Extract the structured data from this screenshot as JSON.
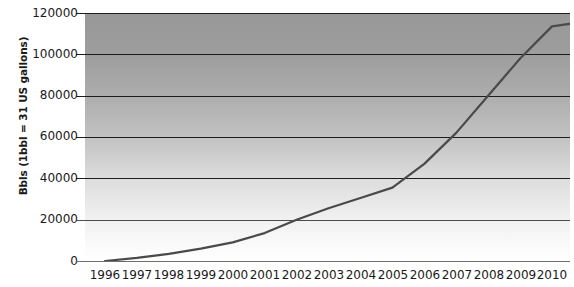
{
  "chart_data": {
    "type": "line",
    "title": "",
    "xlabel": "",
    "ylabel": "Bbls (1bbl = 31 US gallons)",
    "x": [
      1996,
      1997,
      1998,
      1999,
      2000,
      2001,
      2002,
      2003,
      2004,
      2005,
      2006,
      2007,
      2008,
      2009,
      2010
    ],
    "categories": [
      "1996",
      "1997",
      "1998",
      "1999",
      "2000",
      "2001",
      "2002",
      "2003",
      "2004",
      "2005",
      "2006",
      "2007",
      "2008",
      "2009",
      "2010"
    ],
    "values": [
      0,
      1500,
      3500,
      6000,
      9000,
      13500,
      20000,
      25500,
      30500,
      35500,
      47000,
      62000,
      80000,
      98000,
      113500
    ],
    "series": [
      {
        "name": "Bbls",
        "values": [
          0,
          1500,
          3500,
          6000,
          9000,
          13500,
          20000,
          25500,
          30500,
          35500,
          47000,
          62000,
          80000,
          98000,
          113500
        ]
      }
    ],
    "ylim": [
      0,
      120000
    ],
    "xlim": [
      1996,
      2010
    ],
    "yticks": [
      0,
      20000,
      40000,
      60000,
      80000,
      100000,
      120000
    ],
    "ytick_labels": [
      "0",
      "20000",
      "40000",
      "60000",
      "80000",
      "100000",
      "120000"
    ],
    "xticks": [
      1996,
      1997,
      1998,
      1999,
      2000,
      2001,
      2002,
      2003,
      2004,
      2005,
      2006,
      2007,
      2008,
      2009,
      2010
    ],
    "grid": true,
    "grid_axis": "y",
    "legend": false,
    "legend_position": "none",
    "line_color": "#4a4a4a",
    "grid_color": "#1c1c1c",
    "plot_background_gradient_top": "#989898",
    "plot_background_gradient_bottom": "#ffffff",
    "text_color": "#1a1a1a"
  },
  "axes": {
    "y_title": "Bbls (1bbl = 31 US gallons)",
    "y_labels": [
      "120000",
      "100000",
      "80000",
      "60000",
      "40000",
      "20000",
      "0"
    ],
    "x_labels": [
      "1996",
      "1997",
      "1998",
      "1999",
      "2000",
      "2001",
      "2002",
      "2003",
      "2004",
      "2005",
      "2006",
      "2007",
      "2008",
      "2009",
      "2010"
    ]
  }
}
